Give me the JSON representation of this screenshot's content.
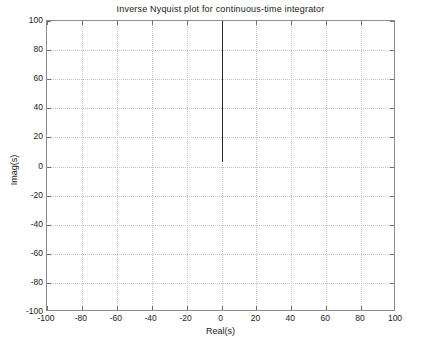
{
  "chart_data": {
    "type": "line",
    "title": "Inverse Nyquist plot for continuous-time integrator",
    "xlabel": "Real(s)",
    "ylabel": "Imag(s)",
    "xlim": [
      -100,
      100
    ],
    "ylim": [
      -100,
      100
    ],
    "xticks": [
      -100,
      -80,
      -60,
      -40,
      -20,
      0,
      20,
      40,
      60,
      80,
      100
    ],
    "yticks": [
      -100,
      -80,
      -60,
      -40,
      -20,
      0,
      20,
      40,
      60,
      80,
      100
    ],
    "xticklabels": [
      "-100",
      "-80",
      "-60",
      "-40",
      "-20",
      "0",
      "20",
      "40",
      "60",
      "80",
      "100"
    ],
    "yticklabels": [
      "-100",
      "-80",
      "-60",
      "-40",
      "-20",
      "0",
      "20",
      "40",
      "60",
      "80",
      "100"
    ],
    "grid": true,
    "grid_style": "dotted",
    "grid_color": "#c4c4c4",
    "legend": null,
    "background": "#ffffff",
    "border_color": "#8c8c8c",
    "series": [
      {
        "name": "1/(jw) inverse locus",
        "color": "#2b2b2b",
        "linewidth": 1,
        "x": [
          0,
          0
        ],
        "y": [
          100,
          3
        ]
      }
    ]
  }
}
